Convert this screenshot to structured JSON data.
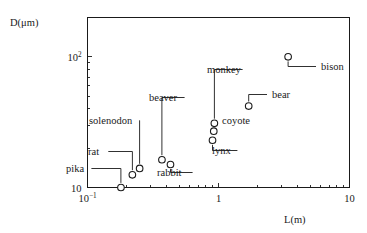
{
  "chart_data": {
    "type": "scatter",
    "title": "",
    "xlabel": "L(m)",
    "ylabel": "D(μm)",
    "xscale": "log",
    "yscale": "log",
    "xlim": [
      0.1,
      10
    ],
    "ylim": [
      10,
      200
    ],
    "grid": false,
    "legend": "none",
    "xticklabels": [
      "10−1",
      "1",
      "10"
    ],
    "xtickvalues": [
      0.1,
      1,
      10
    ],
    "yticklabels": [
      "10",
      "10²"
    ],
    "ytickvalues": [
      10,
      100
    ],
    "points": [
      {
        "label": "pika",
        "x": 0.18,
        "y": 10.0
      },
      {
        "label": "rat",
        "x": 0.22,
        "y": 12.5
      },
      {
        "label": "solenodon",
        "x": 0.25,
        "y": 14.0
      },
      {
        "label": "beaver",
        "x": 0.37,
        "y": 16.3
      },
      {
        "label": "rabbit",
        "x": 0.43,
        "y": 15.0
      },
      {
        "label": "lynx",
        "x": 0.9,
        "y": 23.0
      },
      {
        "label": "coyote",
        "x": 0.92,
        "y": 27.0
      },
      {
        "label": "monkey",
        "x": 0.93,
        "y": 31.0
      },
      {
        "label": "bear",
        "x": 1.7,
        "y": 42.0
      },
      {
        "label": "bison",
        "x": 3.4,
        "y": 100.0
      }
    ],
    "annotations": [
      {
        "label": "pika",
        "text_x": 66,
        "text_y": 172,
        "anchor": "start"
      },
      {
        "label": "rat",
        "text_x": 88,
        "text_y": 155,
        "anchor": "start"
      },
      {
        "label": "solenodon",
        "text_x": 89,
        "text_y": 124,
        "anchor": "start"
      },
      {
        "label": "beaver",
        "text_x": 149,
        "text_y": 101,
        "anchor": "start"
      },
      {
        "label": "rabbit",
        "text_x": 157,
        "text_y": 176,
        "anchor": "start"
      },
      {
        "label": "lynx",
        "text_x": 212,
        "text_y": 154,
        "anchor": "start"
      },
      {
        "label": "coyote",
        "text_x": 222,
        "text_y": 124,
        "anchor": "start"
      },
      {
        "label": "monkey",
        "text_x": 207,
        "text_y": 73,
        "anchor": "start"
      },
      {
        "label": "bear",
        "text_x": 272,
        "text_y": 98,
        "anchor": "start"
      },
      {
        "label": "bison",
        "text_x": 321,
        "text_y": 70,
        "anchor": "start"
      }
    ],
    "axis_label_positions": {
      "ylabel_x": 10,
      "ylabel_y": 26,
      "xlabel_x": 284,
      "xlabel_y": 223
    }
  }
}
